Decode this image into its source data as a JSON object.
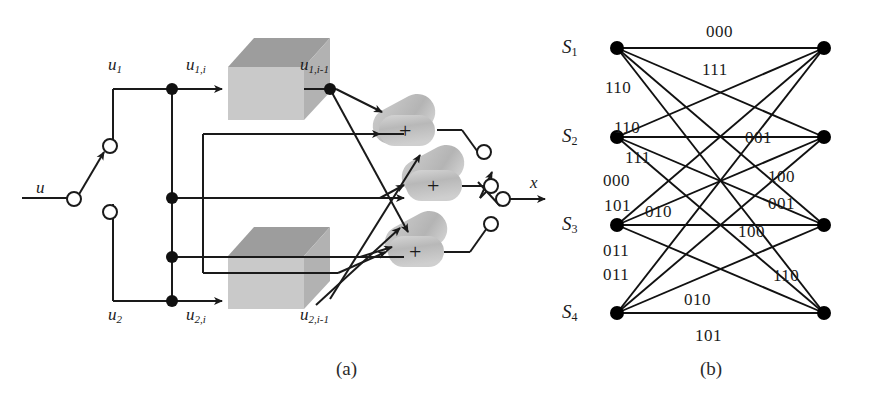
{
  "figure": {
    "caption_a": "(a)",
    "caption_b": "(b)"
  },
  "diagram_a": {
    "name": "convolutional-encoder-block-diagram",
    "input_label": "u",
    "branch_labels": {
      "upper": "u",
      "upper_sub": "1",
      "lower": "u",
      "lower_sub": "2"
    },
    "signals": [
      {
        "base": "u",
        "sub": "1,i",
        "x": 186,
        "y": 73
      },
      {
        "base": "u",
        "sub": "1,i-1",
        "x": 300,
        "y": 73
      },
      {
        "base": "u",
        "sub": "2,i",
        "x": 186,
        "y": 302
      },
      {
        "base": "u",
        "sub": "2,i-1",
        "x": 300,
        "y": 302
      }
    ],
    "delay_blocks": [
      {
        "name": "delay-block-upper",
        "label": ""
      },
      {
        "name": "delay-block-lower",
        "label": ""
      }
    ],
    "adders": [
      {
        "name": "adder-1",
        "symbol": "+"
      },
      {
        "name": "adder-2",
        "symbol": "+"
      },
      {
        "name": "adder-3",
        "symbol": "+"
      }
    ],
    "output_label": "x",
    "colors": {
      "line": "#1a1a1a",
      "block_front": "#c9c9c9",
      "block_top": "#9d9d9d",
      "block_side": "#b5b5b5",
      "adder_fill": "#bdbdbd"
    }
  },
  "diagram_b": {
    "name": "trellis-state-diagram",
    "states": [
      {
        "id": "S1",
        "base": "S",
        "sub": "1",
        "y": 48
      },
      {
        "id": "S2",
        "base": "S",
        "sub": "2",
        "y": 137
      },
      {
        "id": "S3",
        "base": "S",
        "sub": "3",
        "y": 225
      },
      {
        "id": "S4",
        "base": "S",
        "sub": "4",
        "y": 313
      }
    ],
    "left_x": 617,
    "right_x": 824,
    "edges": [
      {
        "from": 0,
        "to": 0,
        "label": "000"
      },
      {
        "from": 0,
        "to": 1,
        "label": "111"
      },
      {
        "from": 0,
        "to": 2,
        "label": "110"
      },
      {
        "from": 0,
        "to": 3,
        "label": "001"
      },
      {
        "from": 1,
        "to": 0,
        "label": "110"
      },
      {
        "from": 1,
        "to": 1,
        "label": "001"
      },
      {
        "from": 1,
        "to": 2,
        "label": "000"
      },
      {
        "from": 1,
        "to": 3,
        "label": "111"
      },
      {
        "from": 2,
        "to": 0,
        "label": "101"
      },
      {
        "from": 2,
        "to": 1,
        "label": "010"
      },
      {
        "from": 2,
        "to": 2,
        "label": "100"
      },
      {
        "from": 2,
        "to": 3,
        "label": "011"
      },
      {
        "from": 3,
        "to": 0,
        "label": "011"
      },
      {
        "from": 3,
        "to": 1,
        "label": "100"
      },
      {
        "from": 3,
        "to": 2,
        "label": "010"
      },
      {
        "from": 3,
        "to": 3,
        "label": "101"
      }
    ],
    "edge_labels": [
      {
        "text": "000",
        "x": 706,
        "y": 22,
        "name": "edge-label-000-top"
      },
      {
        "text": "111",
        "x": 702,
        "y": 60,
        "name": "edge-label-111-upper"
      },
      {
        "text": "110",
        "x": 605,
        "y": 78,
        "name": "edge-label-110-upper"
      },
      {
        "text": "110",
        "x": 614,
        "y": 118,
        "name": "edge-label-110-second"
      },
      {
        "text": "001",
        "x": 745,
        "y": 128,
        "name": "edge-label-001-mid"
      },
      {
        "text": "111",
        "x": 625,
        "y": 148,
        "name": "edge-label-111-lower"
      },
      {
        "text": "000",
        "x": 603,
        "y": 171,
        "name": "edge-label-000-left"
      },
      {
        "text": "100",
        "x": 768,
        "y": 167,
        "name": "edge-label-100-right"
      },
      {
        "text": "101",
        "x": 604,
        "y": 196,
        "name": "edge-label-101-left"
      },
      {
        "text": "001",
        "x": 768,
        "y": 194,
        "name": "edge-label-001-right"
      },
      {
        "text": "010",
        "x": 645,
        "y": 202,
        "name": "edge-label-010-mid"
      },
      {
        "text": "100",
        "x": 738,
        "y": 222,
        "name": "edge-label-100-mid"
      },
      {
        "text": "011",
        "x": 603,
        "y": 241,
        "name": "edge-label-011-upper"
      },
      {
        "text": "011",
        "x": 603,
        "y": 265,
        "name": "edge-label-011-lower"
      },
      {
        "text": "110",
        "x": 773,
        "y": 266,
        "name": "edge-label-110-right"
      },
      {
        "text": "010",
        "x": 684,
        "y": 290,
        "name": "edge-label-010-bottom"
      },
      {
        "text": "101",
        "x": 695,
        "y": 326,
        "name": "edge-label-101-bottom"
      }
    ],
    "colors": {
      "line": "#111111",
      "node": "#000000"
    }
  }
}
